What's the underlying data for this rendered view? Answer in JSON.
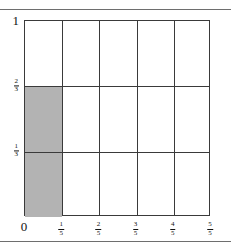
{
  "figure": {
    "title": "",
    "shaded_label": "shaded-region"
  },
  "axes": {
    "x": {
      "ticks": [
        {
          "name": "x-tick-0",
          "kind": "int",
          "text": "0"
        },
        {
          "name": "x-tick-1-5",
          "kind": "frac",
          "num": "1",
          "den": "5"
        },
        {
          "name": "x-tick-2-5",
          "kind": "frac",
          "num": "2",
          "den": "5"
        },
        {
          "name": "x-tick-3-5",
          "kind": "frac",
          "num": "3",
          "den": "5"
        },
        {
          "name": "x-tick-4-5",
          "kind": "frac",
          "num": "4",
          "den": "5"
        },
        {
          "name": "x-tick-5-5",
          "kind": "frac",
          "num": "5",
          "den": "5"
        }
      ]
    },
    "y": {
      "ticks": [
        {
          "name": "y-tick-0",
          "kind": "int",
          "text": "0"
        },
        {
          "name": "y-tick-1-3",
          "kind": "frac",
          "num": "1",
          "den": "3"
        },
        {
          "name": "y-tick-2-3",
          "kind": "frac",
          "num": "2",
          "den": "3"
        },
        {
          "name": "y-tick-1",
          "kind": "int",
          "text": "1"
        }
      ]
    }
  },
  "colors": {
    "shade_fill": "#b3b3b3",
    "grid_line": "#3a3a3a",
    "axis_line": "#3a3a3a",
    "page_rule": "#6e6e6e",
    "text": "#111111",
    "background": "#ffffff"
  },
  "chart_data": {
    "type": "heatmap",
    "title": "",
    "subtitle": "",
    "xlabel": "",
    "ylabel": "",
    "xlim": [
      0,
      1
    ],
    "ylim": [
      0,
      1
    ],
    "grid": true,
    "legend": null,
    "x_tick_values": [
      0,
      0.2,
      0.4,
      0.6,
      0.8,
      1.0
    ],
    "x_tick_labels": [
      "0",
      "1/5",
      "2/5",
      "3/5",
      "4/5",
      "5/5"
    ],
    "y_tick_values": [
      0,
      0.3333333333,
      0.6666666667,
      1.0
    ],
    "y_tick_labels": [
      "0",
      "1/3",
      "2/3",
      "1"
    ],
    "n_columns": 5,
    "n_rows": 3,
    "cell_width": 0.2,
    "cell_height": 0.3333333333,
    "cells": [
      {
        "col": 0,
        "row": 0,
        "x0": 0.0,
        "x1": 0.2,
        "y0": 0.0,
        "y1": 0.3333333,
        "shaded": true
      },
      {
        "col": 0,
        "row": 1,
        "x0": 0.0,
        "x1": 0.2,
        "y0": 0.3333333,
        "y1": 0.6666667,
        "shaded": true
      },
      {
        "col": 0,
        "row": 2,
        "x0": 0.0,
        "x1": 0.2,
        "y0": 0.6666667,
        "y1": 1.0,
        "shaded": false
      },
      {
        "col": 1,
        "row": 0,
        "x0": 0.2,
        "x1": 0.4,
        "y0": 0.0,
        "y1": 0.3333333,
        "shaded": false
      },
      {
        "col": 1,
        "row": 1,
        "x0": 0.2,
        "x1": 0.4,
        "y0": 0.3333333,
        "y1": 0.6666667,
        "shaded": false
      },
      {
        "col": 1,
        "row": 2,
        "x0": 0.2,
        "x1": 0.4,
        "y0": 0.6666667,
        "y1": 1.0,
        "shaded": false
      },
      {
        "col": 2,
        "row": 0,
        "x0": 0.4,
        "x1": 0.6,
        "y0": 0.0,
        "y1": 0.3333333,
        "shaded": false
      },
      {
        "col": 2,
        "row": 1,
        "x0": 0.4,
        "x1": 0.6,
        "y0": 0.3333333,
        "y1": 0.6666667,
        "shaded": false
      },
      {
        "col": 2,
        "row": 2,
        "x0": 0.4,
        "x1": 0.6,
        "y0": 0.6666667,
        "y1": 1.0,
        "shaded": false
      },
      {
        "col": 3,
        "row": 0,
        "x0": 0.6,
        "x1": 0.8,
        "y0": 0.0,
        "y1": 0.3333333,
        "shaded": false
      },
      {
        "col": 3,
        "row": 1,
        "x0": 0.6,
        "x1": 0.8,
        "y0": 0.3333333,
        "y1": 0.6666667,
        "shaded": false
      },
      {
        "col": 3,
        "row": 2,
        "x0": 0.6,
        "x1": 0.8,
        "y0": 0.6666667,
        "y1": 1.0,
        "shaded": false
      },
      {
        "col": 4,
        "row": 0,
        "x0": 0.8,
        "x1": 1.0,
        "y0": 0.0,
        "y1": 0.3333333,
        "shaded": false
      },
      {
        "col": 4,
        "row": 1,
        "x0": 0.8,
        "x1": 1.0,
        "y0": 0.3333333,
        "y1": 0.6666667,
        "shaded": false
      },
      {
        "col": 4,
        "row": 2,
        "x0": 0.8,
        "x1": 1.0,
        "y0": 0.6666667,
        "y1": 1.0,
        "shaded": false
      }
    ],
    "shaded_rectangle": {
      "x0": 0.0,
      "x1": 0.2,
      "y0": 0.0,
      "y1": 0.6666667
    },
    "shaded_area": 0.1333333,
    "annotations": []
  }
}
